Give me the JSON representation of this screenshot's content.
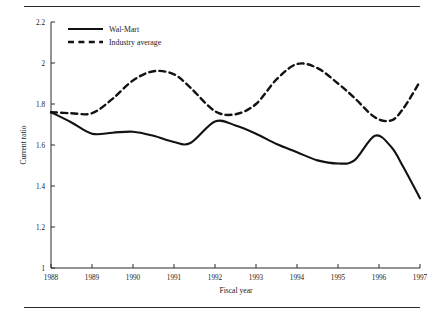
{
  "chart_data": {
    "type": "line",
    "title": "",
    "xlabel": "Fiscal year",
    "ylabel": "Current ratio",
    "xlim": [
      1988,
      1997
    ],
    "ylim": [
      1,
      2.2
    ],
    "ytick_labels": [
      "1",
      "1.2",
      "1.4",
      "1.6",
      "1.8",
      "2",
      "2.2"
    ],
    "ytick_values": [
      1,
      1.2,
      1.4,
      1.6,
      1.8,
      2,
      2.2
    ],
    "xtick_labels": [
      "1988",
      "1989",
      "1990",
      "1991",
      "1992",
      "1993",
      "1994",
      "1995",
      "1996",
      "1997"
    ],
    "xtick_values": [
      1988,
      1989,
      1990,
      1991,
      1992,
      1993,
      1994,
      1995,
      1996,
      1997
    ],
    "grid": false,
    "legend_position": "top-left",
    "x": [
      1988,
      1988.5,
      1989,
      1989.5,
      1990,
      1990.5,
      1991,
      1991.4,
      1992,
      1992.5,
      1993,
      1993.5,
      1994,
      1994.5,
      1995,
      1995.4,
      1995.9,
      1996.3,
      1996.6,
      1997
    ],
    "series": [
      {
        "name": "Wal-Mart",
        "style": "solid",
        "color": "#121212",
        "values": [
          1.76,
          1.71,
          1.655,
          1.66,
          1.665,
          1.645,
          1.615,
          1.61,
          1.715,
          1.695,
          1.655,
          1.605,
          1.565,
          1.525,
          1.51,
          1.525,
          1.645,
          1.59,
          1.49,
          1.34
        ]
      },
      {
        "name": "Industry average",
        "style": "dashed",
        "color": "#121212",
        "values": [
          1.76,
          1.755,
          1.755,
          1.825,
          1.915,
          1.96,
          1.945,
          1.88,
          1.765,
          1.75,
          1.8,
          1.92,
          1.995,
          1.975,
          1.9,
          1.83,
          1.735,
          1.72,
          1.78,
          1.91
        ]
      }
    ]
  },
  "legend": {
    "items": [
      {
        "label": "Wal-Mart",
        "style": "solid"
      },
      {
        "label": "Industry average",
        "style": "dashed"
      }
    ]
  }
}
